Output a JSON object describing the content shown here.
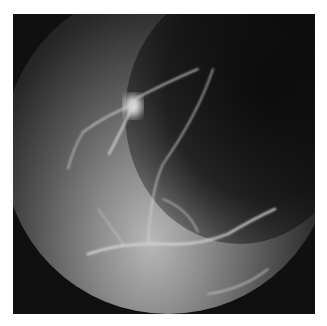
{
  "image": {
    "description": "Grayscale fluorescein angiography fundus photograph showing retinal vessels and a bright optic-disc-like spot",
    "colors": {
      "background": "#ffffff",
      "frame": "#101010",
      "vessel": "#d8d8d8",
      "highlight": "#f0f0f0"
    }
  }
}
